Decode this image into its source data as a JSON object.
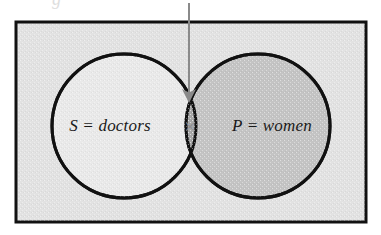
{
  "diagram": {
    "type": "venn",
    "canvas": {
      "width": 381,
      "height": 235,
      "background": "#ffffff"
    },
    "universe_box": {
      "name": "universal-set-rectangle",
      "x": 16,
      "y": 22,
      "width": 350,
      "height": 200,
      "fill": "#e2e2e2",
      "stroke": "#111111",
      "stroke_width": 3
    },
    "sets": [
      {
        "id": "S",
        "label": "S = doctors",
        "symbol": "S",
        "name": "doctors",
        "cx": 124,
        "cy": 126,
        "r": 72,
        "fill": "#e9e9e9",
        "stroke": "#111111",
        "label_x": 110,
        "label_y": 131
      },
      {
        "id": "P",
        "label": "P = women",
        "symbol": "P",
        "name": "women",
        "cx": 258,
        "cy": 126,
        "r": 72,
        "fill": "#c4c4c4",
        "stroke": "#111111",
        "label_x": 272,
        "label_y": 131
      }
    ],
    "intersection": {
      "name": "S-and-P-intersection",
      "fill": "#a8a8a8",
      "mark": "×",
      "mark_x": 190,
      "mark_y": 133,
      "mark_color": "#8d8d8d",
      "meaning": "at least one doctor is a woman"
    },
    "annotation_arrow": {
      "name": "pointer-arrow-to-intersection",
      "from_x": 189,
      "from_y": 3,
      "to_x": 189,
      "to_y": 108,
      "color": "#8a8a8a",
      "stroke_width": 2,
      "head_width": 9,
      "head_length": 14
    },
    "scan_artifacts": {
      "top_ghost": "g",
      "right_ghost": "rr"
    }
  }
}
